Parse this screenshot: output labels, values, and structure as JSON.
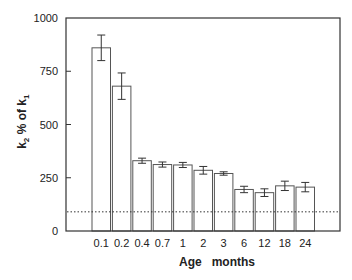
{
  "chart_data": {
    "type": "bar",
    "title": "",
    "xlabel": "Age   months",
    "ylabel": "k2 % of k1",
    "ylabel_parts": {
      "k_main": "k",
      "sub2": "2",
      "mid": " % of ",
      "sub1": "1"
    },
    "ylim": [
      0,
      1000
    ],
    "yticks": [
      0,
      250,
      500,
      750,
      1000
    ],
    "categories": [
      "0.1",
      "0.2",
      "0.4",
      "0.7",
      "1",
      "2",
      "3",
      "6",
      "12",
      "18",
      "24"
    ],
    "values": [
      860,
      680,
      330,
      312,
      310,
      285,
      270,
      195,
      180,
      212,
      206
    ],
    "errors": [
      60,
      62,
      12,
      12,
      12,
      18,
      8,
      15,
      18,
      22,
      22
    ],
    "reference_line": {
      "value": 90,
      "style": "dotted"
    },
    "grid": false,
    "legend": null
  },
  "colors": {
    "axis": "#333333",
    "bar_fill": "#ffffff",
    "bar_stroke": "#555555",
    "error": "#333333",
    "text": "#222222"
  }
}
